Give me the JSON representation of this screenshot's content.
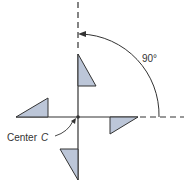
{
  "diagram": {
    "type": "rotational-symmetry",
    "angle_label": "90°",
    "center_label": "Center",
    "center_variable": "C",
    "colors": {
      "fill": "#bcc6d8",
      "stroke": "#333333",
      "background": "#ffffff"
    },
    "shapes": [
      {
        "name": "top-triangle",
        "points": [
          [
            78,
            54
          ],
          [
            78,
            86
          ],
          [
            96,
            86
          ]
        ]
      },
      {
        "name": "left-triangle",
        "points": [
          [
            16,
            117
          ],
          [
            48,
            117
          ],
          [
            48,
            98
          ]
        ]
      },
      {
        "name": "right-triangle",
        "points": [
          [
            110,
            117
          ],
          [
            138,
            117
          ],
          [
            110,
            134
          ]
        ]
      },
      {
        "name": "bottom-triangle",
        "points": [
          [
            60,
            149
          ],
          [
            78,
            149
          ],
          [
            78,
            180
          ]
        ]
      }
    ]
  }
}
